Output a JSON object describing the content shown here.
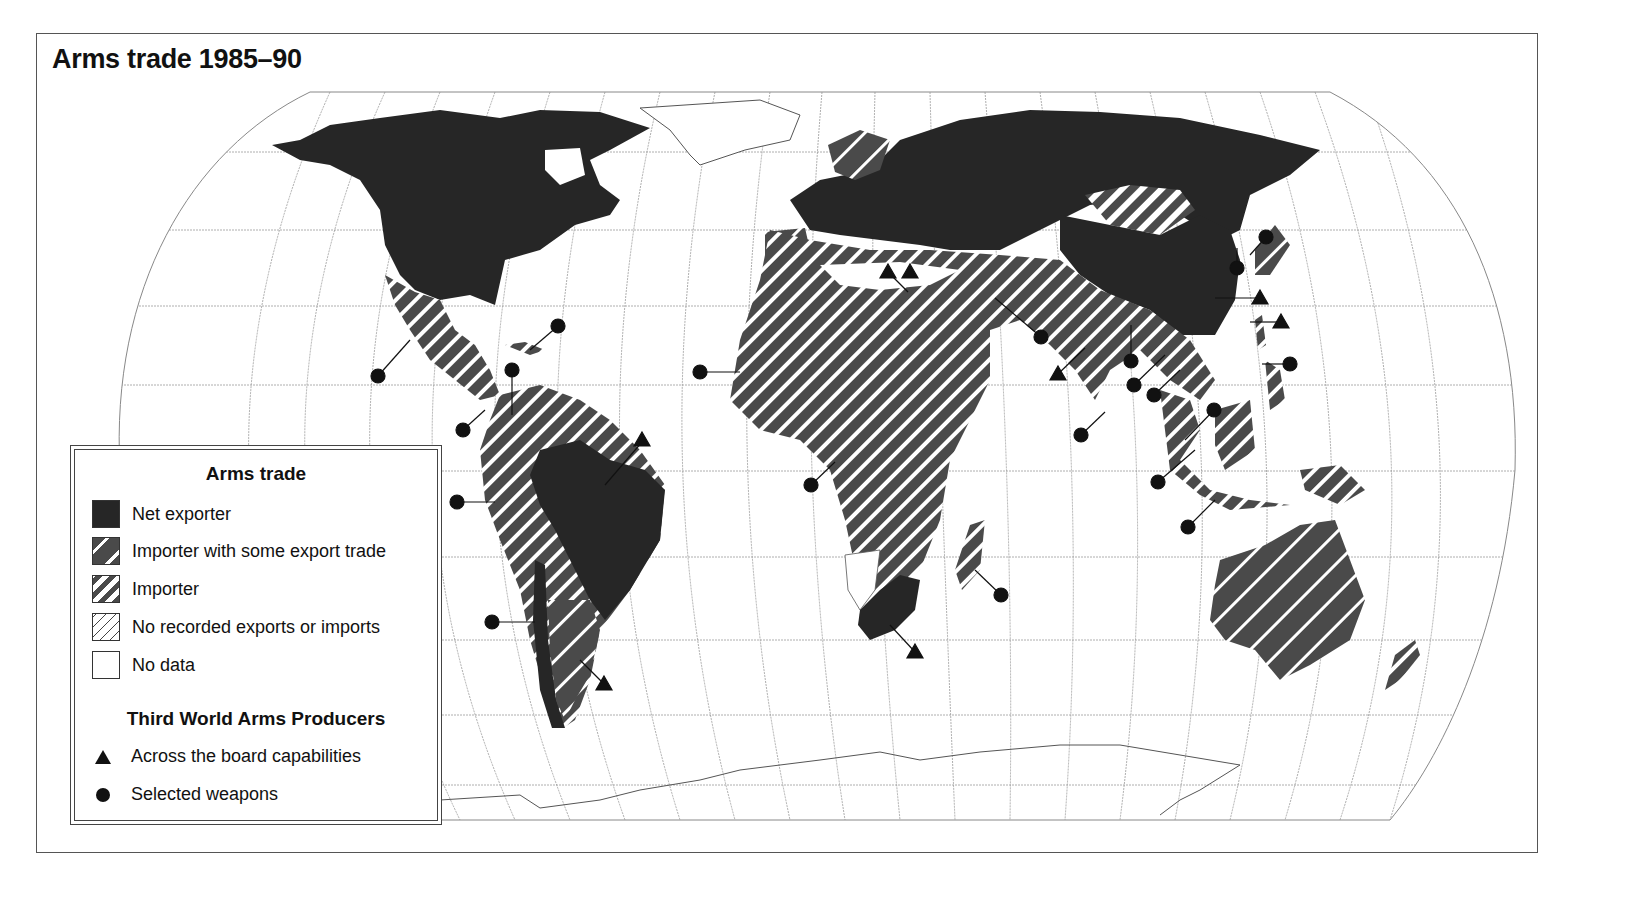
{
  "title": "Arms trade 1985–90",
  "legend": {
    "title": "Arms trade",
    "categories": [
      {
        "label": "Net exporter",
        "pattern": "solid-dark",
        "color": "#262626"
      },
      {
        "label": "Importer with some export trade",
        "pattern": "wide-dark-hatch",
        "color": "#4a4a4a"
      },
      {
        "label": "Importer",
        "pattern": "dense-dark-hatch",
        "color": "#4a4a4a"
      },
      {
        "label": "No recorded exports or imports",
        "pattern": "light-hatch",
        "color": "#444444"
      },
      {
        "label": "No data",
        "pattern": "blank",
        "color": "#ffffff"
      }
    ],
    "producers_title": "Third World Arms Producers",
    "producers": [
      {
        "label": "Across the board capabilities",
        "symbol": "triangle-icon"
      },
      {
        "label": "Selected weapons",
        "symbol": "circle-icon"
      }
    ]
  },
  "map": {
    "projection": "Eckert-style pseudocylindrical world map with graticule",
    "regions": [
      {
        "name": "North America (USA, Canada)",
        "category": "Net exporter"
      },
      {
        "name": "Mexico / Central America",
        "category": "Importer"
      },
      {
        "name": "Brazil",
        "category": "Net exporter"
      },
      {
        "name": "Rest of South America",
        "category": "Importer"
      },
      {
        "name": "Chile strip",
        "category": "Net exporter"
      },
      {
        "name": "Argentina",
        "category": "Importer with some export trade"
      },
      {
        "name": "Greenland",
        "category": "No data"
      },
      {
        "name": "Europe / USSR",
        "category": "Net exporter"
      },
      {
        "name": "Scandinavia / Iberia",
        "category": "Importer with some export trade"
      },
      {
        "name": "Africa / Middle East / South Asia",
        "category": "Importer"
      },
      {
        "name": "Namibia region",
        "category": "No data"
      },
      {
        "name": "South Africa",
        "category": "Net exporter"
      },
      {
        "name": "Mongolia",
        "category": "No recorded exports or imports"
      },
      {
        "name": "China",
        "category": "Net exporter"
      },
      {
        "name": "Southeast Asia / Indonesia",
        "category": "Importer"
      },
      {
        "name": "Australia",
        "category": "Importer with some export trade"
      },
      {
        "name": "Antarctica",
        "category": "No data"
      }
    ],
    "producers_markers": {
      "triangles": [
        "Egypt",
        "Israel",
        "India",
        "China",
        "Taiwan",
        "Brazil",
        "Argentina",
        "South Africa"
      ],
      "circles": [
        "Mexico",
        "Cuba",
        "Colombia",
        "Venezuela",
        "Peru",
        "Chile",
        "Morocco/W.Africa",
        "Angola",
        "Madagascar",
        "Pakistan",
        "Sri Lanka",
        "Bangladesh",
        "Burma",
        "Thailand",
        "Vietnam",
        "Malaysia",
        "Indonesia",
        "Philippines",
        "North Korea",
        "South Korea"
      ]
    }
  }
}
